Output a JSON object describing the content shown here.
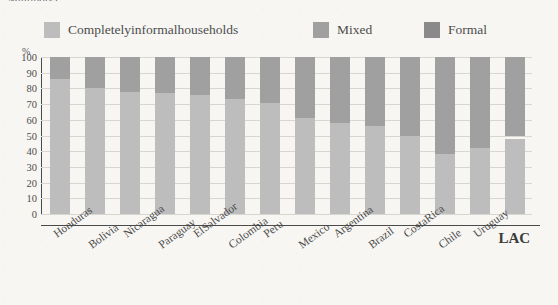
{
  "clipped_title": "Multipoly)",
  "legend": {
    "items": [
      {
        "label": "Completelyinformalhouseholds",
        "color": "#bdbdbd",
        "key": "informal"
      },
      {
        "label": "Mixed",
        "color": "#a0a0a0",
        "key": "mixed"
      },
      {
        "label": "Formal",
        "color": "#8a8a8a",
        "key": "formal"
      }
    ]
  },
  "axis": {
    "y_unit": "%",
    "y_ticks": [
      "0",
      "10",
      "20",
      "30",
      "40",
      "50",
      "60",
      "70",
      "80",
      "90",
      "100"
    ]
  },
  "chart_data": {
    "type": "bar",
    "title": "",
    "subtitle": "",
    "xlabel": "",
    "ylabel": "%",
    "ylim": [
      0,
      100
    ],
    "stacked": true,
    "grid": true,
    "legend_position": "top",
    "categories": [
      "Honduras",
      "Bolivia",
      "Nicaragua",
      "Paraguay",
      "ElSalvador",
      "Colombia",
      "Peru",
      "Mexico",
      "Argentina",
      "Brazil",
      "CostaRica",
      "Chile",
      "Uruguay",
      "LAC"
    ],
    "series": [
      {
        "name": "Completelyinformalhouseholds",
        "color": "#bdbdbd",
        "values": [
          86,
          80,
          78,
          77,
          76,
          73,
          71,
          61,
          58,
          56,
          50,
          38,
          42,
          48
        ]
      },
      {
        "name": "Mixed",
        "color": "#a0a0a0",
        "values": [
          14,
          20,
          22,
          23,
          24,
          27,
          29,
          39,
          42,
          44,
          50,
          62,
          58,
          52
        ]
      },
      {
        "name": "Formal",
        "color": "#8a8a8a",
        "values": [
          0,
          0,
          0,
          0,
          0,
          0,
          0,
          0,
          0,
          0,
          0,
          0,
          0,
          0
        ]
      }
    ],
    "bars": [
      {
        "category": "Honduras",
        "informal": 86,
        "mixed": 14,
        "formal": 0
      },
      {
        "category": "Bolivia",
        "informal": 80,
        "mixed": 20,
        "formal": 0
      },
      {
        "category": "Nicaragua",
        "informal": 78,
        "mixed": 22,
        "formal": 0
      },
      {
        "category": "Paraguay",
        "informal": 77,
        "mixed": 23,
        "formal": 0
      },
      {
        "category": "ElSalvador",
        "informal": 76,
        "mixed": 24,
        "formal": 0
      },
      {
        "category": "Colombia",
        "informal": 73,
        "mixed": 27,
        "formal": 0
      },
      {
        "category": "Peru",
        "informal": 71,
        "mixed": 29,
        "formal": 0
      },
      {
        "category": "Mexico",
        "informal": 61,
        "mixed": 39,
        "formal": 0
      },
      {
        "category": "Argentina",
        "informal": 58,
        "mixed": 42,
        "formal": 0
      },
      {
        "category": "Brazil",
        "informal": 56,
        "mixed": 44,
        "formal": 0
      },
      {
        "category": "CostaRica",
        "informal": 50,
        "mixed": 50,
        "formal": 0
      },
      {
        "category": "Chile",
        "informal": 38,
        "mixed": 62,
        "formal": 0
      },
      {
        "category": "Uruguay",
        "informal": 42,
        "mixed": 58,
        "formal": 0
      },
      {
        "category": "LAC",
        "informal": 48,
        "mixed": 52,
        "formal": 0
      }
    ]
  }
}
